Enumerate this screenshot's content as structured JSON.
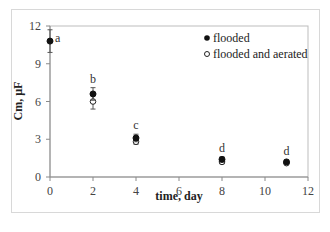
{
  "chart_data": {
    "type": "scatter",
    "title": "",
    "xlabel": "time, day",
    "ylabel": "Cm, µF",
    "xlim": [
      0,
      12
    ],
    "ylim": [
      0,
      12
    ],
    "x_ticks": [
      0,
      2,
      4,
      6,
      8,
      10,
      12
    ],
    "y_ticks": [
      0,
      3,
      6,
      9,
      12
    ],
    "grid": false,
    "legend_position": "upper right (inside)",
    "x": [
      0,
      2,
      4,
      8,
      11
    ],
    "series": [
      {
        "name": "flooded",
        "marker": "filled-circle",
        "x": [
          0,
          2,
          4,
          8,
          11
        ],
        "values": [
          10.8,
          6.6,
          3.1,
          1.4,
          1.2
        ],
        "error": [
          0.9,
          0.5,
          0.3,
          0.2,
          0.15
        ]
      },
      {
        "name": "flooded and aerated",
        "marker": "open-circle",
        "x": [
          2,
          4,
          8,
          11
        ],
        "values": [
          6.0,
          2.8,
          1.2,
          1.1
        ],
        "error": [
          0.6,
          0.2,
          0.15,
          0.1
        ]
      }
    ],
    "annotations": [
      {
        "x": 0,
        "label": "a"
      },
      {
        "x": 2,
        "label": "b"
      },
      {
        "x": 4,
        "label": "c"
      },
      {
        "x": 8,
        "label": "d"
      },
      {
        "x": 11,
        "label": "d"
      }
    ]
  }
}
